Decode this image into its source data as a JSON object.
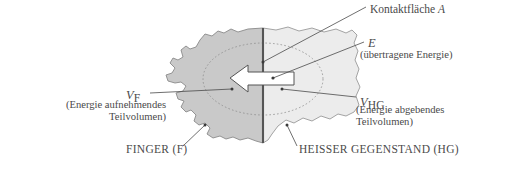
{
  "figure": {
    "type": "physics-schematic-diagram",
    "colors": {
      "finger_fill": "#c9c9c9",
      "hot_object_fill": "#ececec",
      "outline": "#7a7a7a",
      "contact_line": "#555555",
      "text": "#4a4a4a",
      "arrow_fill": "#ffffff",
      "arrow_stroke": "#4a4a4a",
      "ellipse_stroke": "#888888",
      "leader_line": "#4a4a4a",
      "background": "#ffffff"
    }
  },
  "labels": {
    "contact_area": {
      "text": "Kontaktfläche",
      "symbol": "A"
    },
    "energy": {
      "symbol": "E",
      "description": "(übertragene Energie)"
    },
    "volume_hot": {
      "symbol": "V",
      "subscript": "HG",
      "description_line1": "(Energie abgebendes",
      "description_line2": "Teilvolumen)"
    },
    "volume_finger": {
      "symbol": "V",
      "subscript": "F",
      "description_line1": "(Energie aufnehmendes",
      "description_line2": "Teilvolumen)"
    },
    "finger": "FINGER (F)",
    "hot_object": "HEISSER GEGENSTAND (HG)"
  }
}
